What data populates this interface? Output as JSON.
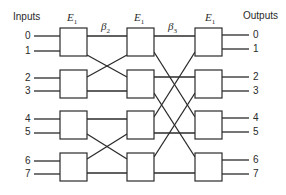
{
  "diagram": {
    "inputs_label": "Inputs",
    "outputs_label": "Outputs",
    "stages": [
      {
        "name": "E",
        "sub": "1",
        "x": 60
      },
      {
        "name": "E",
        "sub": "1",
        "x": 127
      },
      {
        "name": "E",
        "sub": "1",
        "x": 195
      }
    ],
    "interconnects": [
      {
        "name": "β",
        "sub": "2"
      },
      {
        "name": "β",
        "sub": "3"
      }
    ],
    "input_ports": [
      "0",
      "1",
      "2",
      "3",
      "4",
      "5",
      "6",
      "7"
    ],
    "output_ports": [
      "0",
      "1",
      "2",
      "3",
      "4",
      "5",
      "6",
      "7"
    ],
    "colors": {
      "line": "#2b2b2b",
      "box_fill": "#ffffff",
      "background": "#ffffff"
    }
  }
}
